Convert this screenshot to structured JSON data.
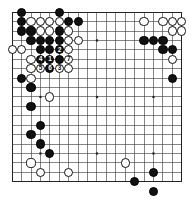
{
  "diagram": {
    "type": "go-board-diagram",
    "board_size": 19,
    "geometry": {
      "origin_x": 12.2,
      "origin_y": 12.2,
      "spacing": 9.42,
      "stone_radius": 4.6,
      "line_color": "#3a3a3a",
      "border_color": "#222222",
      "background": "#ffffff",
      "black_color": "#111111",
      "white_color": "#ffffff"
    },
    "star_points": [
      [
        3,
        3
      ],
      [
        9,
        3
      ],
      [
        15,
        3
      ],
      [
        3,
        9
      ],
      [
        9,
        9
      ],
      [
        15,
        9
      ],
      [
        3,
        15
      ],
      [
        9,
        15
      ],
      [
        15,
        15
      ]
    ],
    "black_stones": [
      [
        1,
        0
      ],
      [
        5,
        0
      ],
      [
        1,
        1
      ],
      [
        6,
        1
      ],
      [
        7,
        1
      ],
      [
        1,
        2
      ],
      [
        2,
        2
      ],
      [
        5,
        2
      ],
      [
        2,
        3
      ],
      [
        3,
        3
      ],
      [
        4,
        3
      ],
      [
        5,
        3
      ],
      [
        3,
        4
      ],
      [
        4,
        4
      ],
      [
        5,
        4
      ],
      [
        3,
        5
      ],
      [
        4,
        5
      ],
      [
        5,
        5
      ],
      [
        1,
        7
      ],
      [
        2,
        8
      ],
      [
        2,
        10
      ],
      [
        3,
        12
      ],
      [
        2,
        13
      ],
      [
        3,
        14
      ],
      [
        4,
        15
      ],
      [
        14,
        3
      ],
      [
        15,
        3
      ],
      [
        16,
        3
      ],
      [
        16,
        4
      ],
      [
        17,
        4
      ],
      [
        17,
        7
      ],
      [
        15,
        17
      ],
      [
        15,
        19
      ],
      [
        13,
        18
      ]
    ],
    "white_stones": [
      [
        2,
        1
      ],
      [
        3,
        1
      ],
      [
        4,
        1
      ],
      [
        5,
        1
      ],
      [
        3,
        2
      ],
      [
        4,
        2
      ],
      [
        6,
        2
      ],
      [
        6,
        3
      ],
      [
        7,
        3
      ],
      [
        0,
        4
      ],
      [
        1,
        4
      ],
      [
        6,
        4
      ],
      [
        2,
        5
      ],
      [
        6,
        5
      ],
      [
        2,
        6
      ],
      [
        3,
        6
      ],
      [
        4,
        6
      ],
      [
        6,
        6
      ],
      [
        2,
        7
      ],
      [
        4,
        9
      ],
      [
        2,
        8
      ],
      [
        14,
        1
      ],
      [
        16,
        1
      ],
      [
        17,
        1
      ],
      [
        18,
        1
      ],
      [
        17,
        2
      ],
      [
        18,
        2
      ],
      [
        17,
        5
      ],
      [
        2,
        16
      ],
      [
        3,
        17
      ],
      [
        6,
        17
      ],
      [
        12,
        16
      ]
    ],
    "numbered_moves": [
      {
        "n": "1",
        "col": 4,
        "row": 5,
        "color": "black"
      },
      {
        "n": "2",
        "col": 5,
        "row": 4,
        "color": "black"
      },
      {
        "n": "3",
        "col": 5,
        "row": 6,
        "color": "white"
      },
      {
        "n": "4",
        "col": 3,
        "row": 5,
        "color": "black"
      },
      {
        "n": "5",
        "col": 3,
        "row": 6,
        "color": "white"
      },
      {
        "n": "6",
        "col": 4,
        "row": 6,
        "color": "black"
      },
      {
        "n": "7",
        "col": 6,
        "row": 5,
        "color": "white"
      }
    ],
    "labels": {
      "move_1": "1",
      "move_2": "2",
      "move_3": "3",
      "move_4": "4",
      "move_5": "5",
      "move_6": "6",
      "move_7": "7"
    }
  }
}
